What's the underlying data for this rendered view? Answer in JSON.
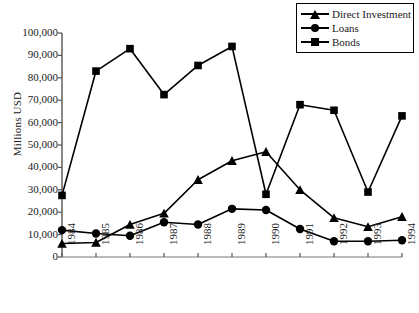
{
  "chart_data": {
    "type": "line",
    "title": "",
    "xlabel": "",
    "ylabel": "Millions USD",
    "categories": [
      "1984",
      "1985",
      "1986",
      "1987",
      "1988",
      "1989",
      "1990",
      "1991",
      "1992",
      "1993",
      "1994"
    ],
    "ylim": [
      0,
      100000
    ],
    "ytick_values": [
      0,
      10000,
      20000,
      30000,
      40000,
      50000,
      60000,
      70000,
      80000,
      90000,
      100000
    ],
    "ytick_labels": [
      "0",
      "10,000",
      "20,000",
      "30,000",
      "40,000",
      "50,000",
      "60,000",
      "70,000",
      "80,000",
      "90,000",
      "100,000"
    ],
    "grid": false,
    "legend_position": "top-right",
    "series": [
      {
        "name": "Direct Investment",
        "marker": "triangle",
        "color": "#000000",
        "values": [
          6000,
          6500,
          14500,
          19500,
          34500,
          43000,
          47000,
          30000,
          17500,
          13500,
          18000
        ]
      },
      {
        "name": "Loans",
        "marker": "circle",
        "color": "#000000",
        "values": [
          12000,
          10500,
          9500,
          15500,
          14500,
          21500,
          21000,
          12500,
          7000,
          7000,
          7500
        ]
      },
      {
        "name": "Bonds",
        "marker": "square",
        "color": "#000000",
        "values": [
          27500,
          83000,
          93000,
          72500,
          85500,
          94000,
          28000,
          68000,
          65500,
          29000,
          63000
        ]
      }
    ]
  },
  "axes": {
    "y_title": "Millions USD"
  },
  "legend": {
    "items": [
      {
        "label": "Direct Investment",
        "marker": "triangle"
      },
      {
        "label": "Loans",
        "marker": "circle"
      },
      {
        "label": "Bonds",
        "marker": "square"
      }
    ]
  },
  "artifact": {
    "top_text": ""
  }
}
